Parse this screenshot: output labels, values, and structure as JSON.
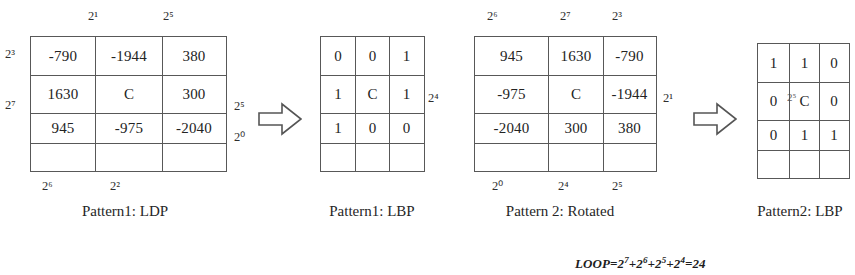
{
  "figure": {
    "formula": {
      "name": "LOOP",
      "text": "LOOP=2",
      "terms": [
        "7",
        "6",
        "5",
        "4"
      ],
      "plus": "+",
      "equals": "=",
      "base": "2",
      "result": "24"
    }
  },
  "panels": [
    {
      "id": "pattern1-ldp",
      "caption": "Pattern1: LDP",
      "cells": [
        [
          "-790",
          "-1944",
          "380"
        ],
        [
          "1630",
          "C",
          "300"
        ],
        [
          "945",
          "-975",
          "-2040"
        ]
      ],
      "labels": {
        "top": [
          "",
          "2¹",
          "2⁵"
        ],
        "left": [
          "2³",
          "2⁷",
          ""
        ],
        "right": [
          "",
          "2⁵",
          "2⁰"
        ],
        "bottom": [
          "2⁶",
          "2²",
          ""
        ]
      }
    },
    {
      "id": "pattern1-lbp",
      "caption": "Pattern1: LBP",
      "cells": [
        [
          "0",
          "0",
          "1"
        ],
        [
          "1",
          "C",
          "1"
        ],
        [
          "1",
          "0",
          "0"
        ]
      ],
      "labels": {
        "top": [
          "",
          "",
          ""
        ],
        "left": [
          "",
          "",
          ""
        ],
        "right": [
          "",
          "",
          ""
        ],
        "bottom": [
          "",
          "",
          ""
        ]
      }
    },
    {
      "id": "pattern2-rotated",
      "caption": "Pattern 2: Rotated",
      "cells": [
        [
          "945",
          "1630",
          "-790"
        ],
        [
          "-975",
          "C",
          "-1944"
        ],
        [
          "-2040",
          "300",
          "380"
        ]
      ],
      "labels": {
        "top": [
          "2⁶",
          "2⁷",
          "2³"
        ],
        "left": [
          "",
          "2⁴",
          ""
        ],
        "right": [
          "",
          "2¹",
          ""
        ],
        "bottom": [
          "2⁰",
          "2⁴",
          "2⁵"
        ]
      }
    },
    {
      "id": "pattern2-lbp",
      "caption": "Pattern2: LBP",
      "cells": [
        [
          "1",
          "1",
          "0"
        ],
        [
          "0",
          "C",
          "0"
        ],
        [
          "0",
          "1",
          "1"
        ]
      ],
      "labels": {
        "top": [
          "",
          "",
          ""
        ],
        "left": [
          "",
          "",
          ""
        ],
        "right": [
          "",
          "",
          ""
        ],
        "bottom": [
          "",
          "",
          ""
        ]
      },
      "artifact": "2⁵"
    }
  ],
  "arrows": [
    {
      "id": "arrow-1",
      "glyph": "right-arrow"
    },
    {
      "id": "arrow-2",
      "glyph": "right-arrow"
    }
  ]
}
